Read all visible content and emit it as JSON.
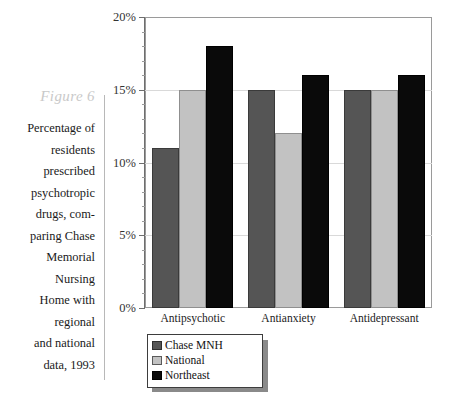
{
  "figure": {
    "label": "Figure 6",
    "caption_lines": [
      "Percentage of",
      "residents",
      "prescribed",
      "psychotropic",
      "drugs, com-",
      "paring Chase",
      "Memorial",
      "Nursing",
      "Home with",
      "regional",
      "and national",
      "data, 1993"
    ]
  },
  "chart_data": {
    "type": "bar",
    "title": "",
    "xlabel": "",
    "ylabel": "",
    "categories": [
      "Antipsychotic",
      "Antianxiety",
      "Antidepressant"
    ],
    "series": [
      {
        "name": "Chase MNH",
        "color": "#555555",
        "values": [
          11,
          15,
          15
        ]
      },
      {
        "name": "National",
        "color": "#c2c2c2",
        "values": [
          15,
          12,
          15
        ]
      },
      {
        "name": "Northeast",
        "color": "#0a0a0a",
        "values": [
          18,
          16,
          16
        ]
      }
    ],
    "ylim": [
      0,
      20
    ],
    "ytick_values": [
      0,
      5,
      10,
      15,
      20
    ],
    "ytick_labels": [
      "0%",
      "5%",
      "10%",
      "15%",
      "20%"
    ],
    "yminor_step": 1,
    "grid": true,
    "legend_position": "below-left"
  }
}
